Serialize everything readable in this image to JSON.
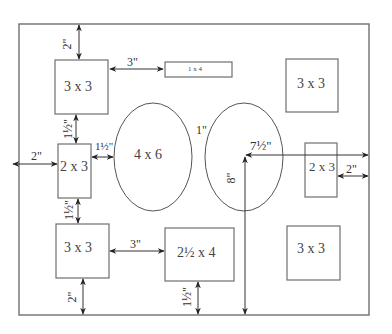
{
  "diagram": {
    "frame_border": {
      "x": 19,
      "y": 24,
      "width": 350,
      "height": 291
    },
    "openings": [
      {
        "id": "top-left-square",
        "shape": "rect",
        "label": "3 x 3",
        "x": 55,
        "y": 60,
        "w": 53,
        "h": 54
      },
      {
        "id": "top-center-strip",
        "shape": "rect",
        "label": "1 x 4",
        "x": 165,
        "y": 62,
        "w": 67,
        "h": 15
      },
      {
        "id": "top-right-square",
        "shape": "rect",
        "label": "3 x 3",
        "x": 286,
        "y": 59,
        "w": 52,
        "h": 53
      },
      {
        "id": "left-rect",
        "shape": "rect",
        "label": "2 x 3",
        "x": 58,
        "y": 144,
        "w": 33,
        "h": 54
      },
      {
        "id": "left-oval",
        "shape": "ellipse",
        "label": "4 x 6",
        "cx": 153,
        "cy": 157,
        "rx": 39,
        "ry": 54
      },
      {
        "id": "right-oval",
        "shape": "ellipse",
        "label": "",
        "cx": 244,
        "cy": 157,
        "rx": 39,
        "ry": 54
      },
      {
        "id": "right-rect",
        "shape": "rect",
        "label": "2 x 3",
        "x": 305,
        "y": 143,
        "w": 32,
        "h": 54
      },
      {
        "id": "bottom-left-square",
        "shape": "rect",
        "label": "3 x 3",
        "x": 56,
        "y": 224,
        "w": 53,
        "h": 54
      },
      {
        "id": "bottom-center-rect",
        "shape": "rect",
        "label": "2½ x 4",
        "x": 165,
        "y": 228,
        "w": 69,
        "h": 53
      },
      {
        "id": "bottom-right-square",
        "shape": "rect",
        "label": "3 x 3",
        "x": 287,
        "y": 226,
        "w": 53,
        "h": 54
      }
    ],
    "dimensions": {
      "top_margin": "2\"",
      "square_to_strip": "3\"",
      "square_to_left_rect": "1½\"",
      "left_rect_to_oval": "1½\"",
      "left_margin": "2\"",
      "oval_gap": "1\"",
      "center_horizontal": "7½\"",
      "center_vertical": "8\"",
      "right_margin": "2\"",
      "left_rect_to_bottom_square": "1½\"",
      "bottom_square_to_rect": "3\"",
      "bottom_left_margin": "2\"",
      "bottom_center_margin": "1½\""
    },
    "colors": {
      "stroke": "#6f6f6f",
      "text": "#444444",
      "arrow": "#333333",
      "background": "#ffffff"
    }
  }
}
